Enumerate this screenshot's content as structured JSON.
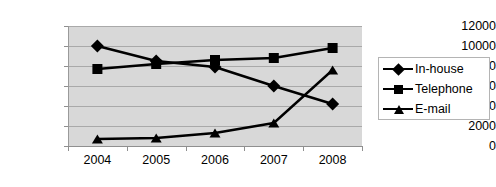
{
  "chart_data": {
    "type": "line",
    "title": "",
    "xlabel": "",
    "ylabel": "",
    "categories": [
      "2004",
      "2005",
      "2006",
      "2007",
      "2008"
    ],
    "ylim": [
      0,
      12000
    ],
    "ytick_step": 2000,
    "yticks": [
      "12000",
      "10000",
      "8000",
      "6000",
      "4000",
      "2000",
      "0"
    ],
    "grid": true,
    "legend_position": "right",
    "series": [
      {
        "name": "In-house",
        "marker": "diamond",
        "color": "#000000",
        "values": [
          10000,
          8500,
          7900,
          6000,
          4200
        ]
      },
      {
        "name": "Telephone",
        "marker": "square",
        "color": "#000000",
        "values": [
          7700,
          8200,
          8600,
          8800,
          9800
        ]
      },
      {
        "name": "E-mail",
        "marker": "triangle",
        "color": "#000000",
        "values": [
          700,
          800,
          1300,
          2300,
          7600
        ]
      }
    ]
  },
  "legend": {
    "items": [
      {
        "label": "In-house",
        "marker": "diamond-marker-icon"
      },
      {
        "label": "Telephone",
        "marker": "square-marker-icon"
      },
      {
        "label": "E-mail",
        "marker": "triangle-marker-icon"
      }
    ]
  },
  "axes": {
    "y_tick_labels": [
      "12000",
      "10000",
      "8000",
      "6000",
      "4000",
      "2000",
      "0"
    ],
    "x_tick_labels": [
      "2004",
      "2005",
      "2006",
      "2007",
      "2008"
    ]
  },
  "colors": {
    "plot_background": "#d8d8d8",
    "gridline": "#a9a9a9",
    "series": "#000000",
    "page_background": "#ffffff",
    "legend_border": "#b4b4b4"
  }
}
